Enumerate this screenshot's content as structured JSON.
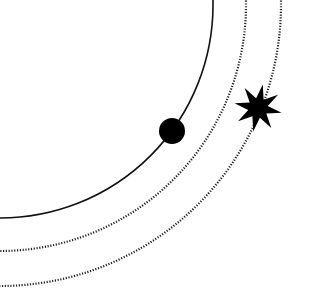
{
  "diagram": {
    "type": "orbital-arcs",
    "background": "#ffffff",
    "ink": "#111111",
    "center": {
      "x": 0,
      "y": 5
    },
    "arcs": [
      {
        "name": "inner-orbit",
        "style": "solid",
        "radius": 213
      },
      {
        "name": "middle-orbit",
        "style": "dotted",
        "radius": 246
      },
      {
        "name": "outer-orbit",
        "style": "dotted",
        "radius": 281
      }
    ],
    "markers": [
      {
        "name": "planet",
        "shape": "circle",
        "x": 172,
        "y": 131,
        "r": 13,
        "on_arc": "inner-orbit"
      },
      {
        "name": "star",
        "shape": "8-point-star",
        "x": 258,
        "y": 108,
        "outer_r": 24,
        "inner_r": 10,
        "on_arc": "outer-orbit"
      }
    ]
  }
}
